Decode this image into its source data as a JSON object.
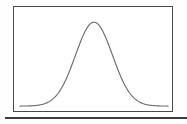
{
  "figure": {
    "title": "",
    "caption": "",
    "frame_color": "#4a4a4a",
    "curve_color": "#6b6b6b",
    "background_color": "#ffffff",
    "rule_color": "#3c3c3c"
  },
  "chart_data": {
    "type": "line",
    "title": "",
    "subtitle": "",
    "xlabel": "",
    "ylabel": "",
    "grid": false,
    "legend": null,
    "annotations": [],
    "xtick_labels": [],
    "ytick_labels": [],
    "xlim": [
      -4,
      4
    ],
    "ylim": [
      0,
      0.42
    ],
    "series": [
      {
        "name": "normal-distribution",
        "mean": 0,
        "std": 1,
        "x": [
          -4,
          -3.75,
          -3.5,
          -3.25,
          -3,
          -2.75,
          -2.5,
          -2.25,
          -2,
          -1.75,
          -1.5,
          -1.25,
          -1,
          -0.75,
          -0.5,
          -0.25,
          0,
          0.25,
          0.5,
          0.75,
          1,
          1.25,
          1.5,
          1.75,
          2,
          2.25,
          2.5,
          2.75,
          3,
          3.25,
          3.5,
          3.75,
          4
        ],
        "values": [
          0.0001,
          0.0004,
          0.0009,
          0.002,
          0.0044,
          0.0091,
          0.0175,
          0.0317,
          0.054,
          0.0863,
          0.1295,
          0.1826,
          0.242,
          0.3011,
          0.3521,
          0.3867,
          0.3989,
          0.3867,
          0.3521,
          0.3011,
          0.242,
          0.1826,
          0.1295,
          0.0863,
          0.054,
          0.0317,
          0.0175,
          0.0091,
          0.0044,
          0.002,
          0.0009,
          0.0004,
          0.0001
        ]
      }
    ]
  }
}
